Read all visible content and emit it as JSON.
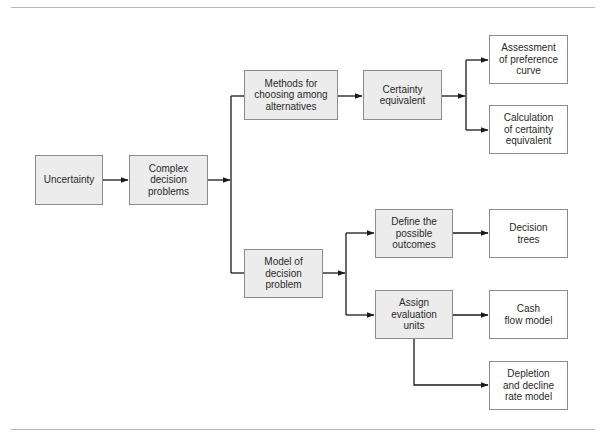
{
  "diagram": {
    "type": "flowchart",
    "colors": {
      "shaded_fill": "#ececec",
      "plain_fill": "#ffffff",
      "border": "#8c8c8c",
      "line": "#1a1a1a",
      "rule": "#b8b8b8"
    },
    "nodes": {
      "uncertainty": {
        "label": "Uncertainty",
        "style": "shaded"
      },
      "complex": {
        "label": "Complex\ndecision\nproblems",
        "style": "shaded"
      },
      "methods": {
        "label": "Methods for\nchoosing among\nalternatives",
        "style": "shaded"
      },
      "certainty": {
        "label": "Certainty\nequivalent",
        "style": "shaded"
      },
      "assessment": {
        "label": "Assessment\nof preference\ncurve",
        "style": "plain"
      },
      "calculation": {
        "label": "Calculation\nof certainty\nequivalent",
        "style": "plain"
      },
      "model": {
        "label": "Model of\ndecision\nproblem",
        "style": "shaded"
      },
      "define": {
        "label": "Define the\npossible\noutcomes",
        "style": "shaded"
      },
      "trees": {
        "label": "Decision\ntrees",
        "style": "plain"
      },
      "assign": {
        "label": "Assign\nevaluation\nunits",
        "style": "shaded"
      },
      "cashflow": {
        "label": "Cash\nflow model",
        "style": "plain"
      },
      "depletion": {
        "label": "Depletion\nand decline\nrate model",
        "style": "plain"
      }
    },
    "edges": [
      {
        "from": "uncertainty",
        "to": "complex"
      },
      {
        "from": "complex",
        "to": "methods"
      },
      {
        "from": "complex",
        "to": "model"
      },
      {
        "from": "methods",
        "to": "certainty"
      },
      {
        "from": "certainty",
        "to": "assessment"
      },
      {
        "from": "certainty",
        "to": "calculation"
      },
      {
        "from": "model",
        "to": "define"
      },
      {
        "from": "model",
        "to": "assign"
      },
      {
        "from": "define",
        "to": "trees"
      },
      {
        "from": "assign",
        "to": "cashflow"
      },
      {
        "from": "assign",
        "to": "depletion"
      }
    ]
  }
}
